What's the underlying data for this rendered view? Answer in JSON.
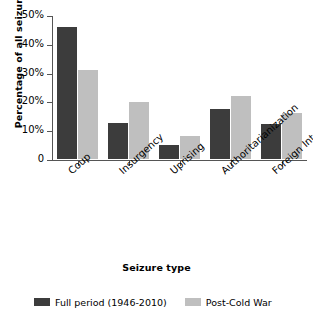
{
  "chart_data": {
    "type": "bar",
    "title": "",
    "xlabel": "Seizure type",
    "ylabel": "Percentage of all seizures",
    "categories": [
      "Coup",
      "Insurgency",
      "Uprising",
      "Authoritarianization",
      "Foreign Intervention"
    ],
    "series": [
      {
        "name": "Full period (1946-2010)",
        "color": "#3c3c3c",
        "values": [
          46,
          12.5,
          5,
          17.5,
          12
        ]
      },
      {
        "name": "Post-Cold War",
        "color": "#bfbfbf",
        "values": [
          31,
          19.8,
          8,
          22,
          16
        ]
      }
    ],
    "ylim": [
      0,
      50
    ],
    "yticks": [
      0,
      10,
      20,
      30,
      40,
      50
    ],
    "ytick_labels": [
      "0",
      "10%",
      "20%",
      "30%",
      "40%",
      "50%"
    ],
    "grid": false,
    "legend_position": "bottom"
  }
}
